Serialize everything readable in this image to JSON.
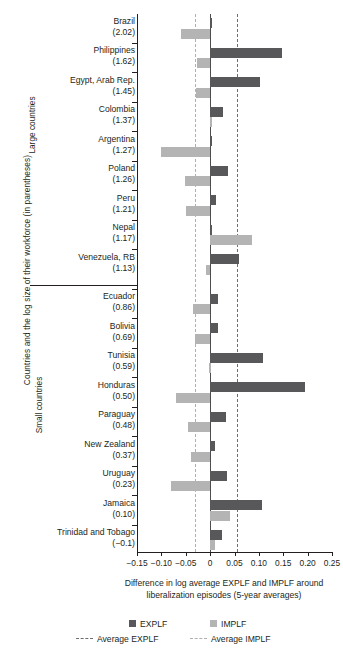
{
  "chart_data": {
    "type": "bar",
    "orientation": "horizontal",
    "title": "",
    "xlabel": "Difference in log average EXPLF and IMPLF around liberalization episodes (5-year averages)",
    "ylabel": "Countries and the log size of their workforce (in parentheses)",
    "xlim": [
      -0.15,
      0.25
    ],
    "xticks": [
      "−0.15",
      "−0.10",
      "−0.05",
      "0",
      "0.05",
      "0.10",
      "0.15",
      "0.20",
      "0.25"
    ],
    "xtick_values": [
      -0.15,
      -0.1,
      -0.05,
      0,
      0.05,
      0.1,
      0.15,
      0.2,
      0.25
    ],
    "grid": false,
    "legend_position": "bottom",
    "groups": [
      {
        "name": "Large countries",
        "count": 9
      },
      {
        "name": "Small countries",
        "count": 9
      }
    ],
    "series": [
      {
        "name": "EXPLF",
        "color": "#58585a"
      },
      {
        "name": "IMPLF",
        "color": "#b4b4b4"
      }
    ],
    "reference_lines": [
      {
        "name": "Average EXPLF",
        "value": 0.055,
        "style": "dashed",
        "color": "#6d6e71"
      },
      {
        "name": "Average IMPLF",
        "value": -0.032,
        "style": "dashed",
        "color": "#b0b0b0"
      }
    ],
    "categories": [
      {
        "country": "Brazil",
        "size": "(2.02)",
        "group": "Large countries",
        "explf": 0.002,
        "implf": -0.06
      },
      {
        "country": "Philippines",
        "size": "(1.62)",
        "group": "Large countries",
        "explf": 0.148,
        "implf": -0.027
      },
      {
        "country": "Egypt, Arab Rep.",
        "size": "(1.45)",
        "group": "Large countries",
        "explf": 0.103,
        "implf": -0.028
      },
      {
        "country": "Colombia",
        "size": "(1.37)",
        "group": "Large countries",
        "explf": 0.027,
        "implf": 0.004
      },
      {
        "country": "Argentina",
        "size": "(1.27)",
        "group": "Large countries",
        "explf": 0.004,
        "implf": -0.1
      },
      {
        "country": "Poland",
        "size": "(1.26)",
        "group": "Large countries",
        "explf": 0.036,
        "implf": -0.052
      },
      {
        "country": "Peru",
        "size": "(1.21)",
        "group": "Large countries",
        "explf": 0.012,
        "implf": -0.05
      },
      {
        "country": "Nepal",
        "size": "(1.17)",
        "group": "Large countries",
        "explf": 0.002,
        "implf": 0.085
      },
      {
        "country": "Venezuela, RB",
        "size": "(1.13)",
        "group": "Large countries",
        "explf": 0.06,
        "implf": -0.008
      },
      {
        "country": "Ecuador",
        "size": "(0.86)",
        "group": "Small countries",
        "explf": 0.016,
        "implf": -0.035
      },
      {
        "country": "Bolivia",
        "size": "(0.69)",
        "group": "Small countries",
        "explf": 0.016,
        "implf": -0.032
      },
      {
        "country": "Tunisia",
        "size": "(0.59)",
        "group": "Small countries",
        "explf": 0.108,
        "implf": -0.002
      },
      {
        "country": "Honduras",
        "size": "(0.50)",
        "group": "Small countries",
        "explf": 0.194,
        "implf": -0.07
      },
      {
        "country": "Paraguay",
        "size": "(0.48)",
        "group": "Small countries",
        "explf": 0.032,
        "implf": -0.045
      },
      {
        "country": "New Zealand",
        "size": "(0.37)",
        "group": "Small countries",
        "explf": 0.009,
        "implf": -0.04
      },
      {
        "country": "Uruguay",
        "size": "(0.23)",
        "group": "Small countries",
        "explf": 0.034,
        "implf": -0.08
      },
      {
        "country": "Jamaica",
        "size": "(0.10)",
        "group": "Small countries",
        "explf": 0.107,
        "implf": 0.04
      },
      {
        "country": "Trinidad and Tobago",
        "size": "(−0.1)",
        "group": "Small countries",
        "explf": 0.024,
        "implf": 0.011
      }
    ]
  },
  "axis": {
    "y_title": "Countries and the log size of their workforce (in parentheses)",
    "group_large": "Large countries",
    "group_small": "Small countries",
    "x_title_line1": "Difference in log average EXPLF and IMPLF around",
    "x_title_line2": "liberalization episodes (5-year averages)"
  },
  "legend": {
    "explf": "EXPLF",
    "implf": "IMPLF",
    "avg_explf": "Average EXPLF",
    "avg_implf": "Average IMPLF"
  }
}
